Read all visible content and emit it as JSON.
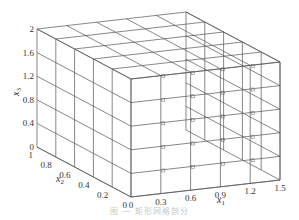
{
  "figure": {
    "type": "3d-wireframe-grid",
    "line_color": "#555555",
    "marker_color": "#666666",
    "axes": {
      "x1": {
        "label": "x",
        "sub": "1",
        "ticks": [
          "0",
          "0.3",
          "0.6",
          "0.9",
          "1.2",
          "1.5"
        ],
        "values": [
          0,
          0.3,
          0.6,
          0.9,
          1.2,
          1.5
        ]
      },
      "x2": {
        "label": "x",
        "sub": "2",
        "ticks": [
          "0",
          "0.2",
          "0.4",
          "0.6",
          "0.8",
          "1"
        ],
        "values": [
          0,
          0.2,
          0.4,
          0.6,
          0.8,
          1
        ]
      },
      "x3": {
        "label": "x",
        "sub": "3",
        "ticks": [
          "0",
          "0.4",
          "0.8",
          "1.2",
          "1.6",
          "2"
        ],
        "values": [
          0,
          0.4,
          0.8,
          1.2,
          1.6,
          2
        ]
      }
    },
    "grid": {
      "n1": 5,
      "n2": 5,
      "n3": 5,
      "x1_max": 1.5,
      "x2_max": 1,
      "x3_max": 2
    }
  },
  "caption": "图 —  矩形网格剖分"
}
